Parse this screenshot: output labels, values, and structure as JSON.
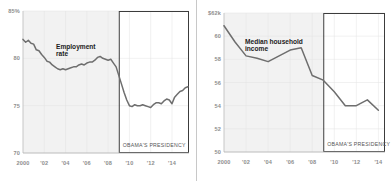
{
  "figure": {
    "panels": [
      {
        "id": "employment-rate",
        "series_title_line1": "Employment",
        "series_title_line2": "rate",
        "annotation": "OBAMA'S PRESIDENCY",
        "y_ticks": [
          "85%",
          "80",
          "75",
          "70"
        ],
        "x_ticks": [
          "2000",
          "'02",
          "'04",
          "'06",
          "'08",
          "'10",
          "'12",
          "'14"
        ]
      },
      {
        "id": "median-household-income",
        "series_title_line1": "Median household",
        "series_title_line2": "income",
        "annotation": "OBAMA'S PRESIDENCY",
        "y_ticks": [
          "$62k",
          "60",
          "58",
          "56",
          "54",
          "52",
          "50"
        ],
        "x_ticks": [
          "2000",
          "'02",
          "'04",
          "'06",
          "'08",
          "'10",
          "'12",
          "'14"
        ]
      }
    ]
  },
  "colors": {
    "line": "#6e6e6e",
    "plot_background": "#f2f2f2",
    "highlight_background": "#ffffff",
    "highlight_border": "#3c3c3c",
    "grid": "#e2e2e2",
    "axis": "#b4b4b4",
    "tick_text": "#8e8e8e",
    "title_text": "#1c1c1c",
    "annotation_text": "#555555"
  },
  "chart_data": [
    {
      "type": "line",
      "title": "Employment rate",
      "xlabel": "",
      "ylabel": "Employment rate (%)",
      "ylim": [
        70,
        85
      ],
      "xlim": [
        2000,
        2015.6
      ],
      "grid": true,
      "legend_position": "inline-label",
      "y_tick_values": [
        85,
        80,
        75,
        70
      ],
      "y_tick_labels": [
        "85%",
        "80",
        "75",
        "70"
      ],
      "x_tick_values": [
        2000,
        2002,
        2004,
        2006,
        2008,
        2010,
        2012,
        2014
      ],
      "x_tick_labels": [
        "2000",
        "'02",
        "'04",
        "'06",
        "'08",
        "'10",
        "'12",
        "'14"
      ],
      "annotations": [
        {
          "text": "OBAMA'S PRESIDENCY",
          "x_start": 2009.0,
          "x_end": 2015.6,
          "type": "shaded-box"
        }
      ],
      "x": [
        2000.0,
        2000.25,
        2000.5,
        2000.75,
        2001.0,
        2001.25,
        2001.5,
        2001.75,
        2002.0,
        2002.25,
        2002.5,
        2002.75,
        2003.0,
        2003.25,
        2003.5,
        2003.75,
        2004.0,
        2004.25,
        2004.5,
        2004.75,
        2005.0,
        2005.25,
        2005.5,
        2005.75,
        2006.0,
        2006.25,
        2006.5,
        2006.75,
        2007.0,
        2007.25,
        2007.5,
        2007.75,
        2008.0,
        2008.25,
        2008.5,
        2008.75,
        2009.0,
        2009.25,
        2009.5,
        2009.75,
        2010.0,
        2010.25,
        2010.5,
        2010.75,
        2011.0,
        2011.25,
        2011.5,
        2011.75,
        2012.0,
        2012.25,
        2012.5,
        2012.75,
        2013.0,
        2013.25,
        2013.5,
        2013.75,
        2014.0,
        2014.25,
        2014.5,
        2014.75,
        2015.0,
        2015.25,
        2015.5
      ],
      "values": [
        82.0,
        81.7,
        81.9,
        81.6,
        81.5,
        80.9,
        80.8,
        80.4,
        80.1,
        79.7,
        79.6,
        79.3,
        79.1,
        78.9,
        78.8,
        78.9,
        78.8,
        78.9,
        79.0,
        79.1,
        79.1,
        79.3,
        79.4,
        79.3,
        79.5,
        79.6,
        79.6,
        79.8,
        80.1,
        80.2,
        80.0,
        79.9,
        79.8,
        79.9,
        79.5,
        79.1,
        78.2,
        77.3,
        76.4,
        75.6,
        75.0,
        74.9,
        75.1,
        75.0,
        75.0,
        75.1,
        75.0,
        74.9,
        74.8,
        75.1,
        75.3,
        75.3,
        75.2,
        75.5,
        75.7,
        75.6,
        75.2,
        75.9,
        76.2,
        76.5,
        76.6,
        76.9,
        77.0
      ]
    },
    {
      "type": "line",
      "title": "Median household income",
      "xlabel": "",
      "ylabel": "Median household income ($ thousands)",
      "ylim": [
        50,
        62
      ],
      "xlim": [
        2000,
        2014.6
      ],
      "grid": true,
      "legend_position": "inline-label",
      "y_tick_values": [
        62,
        60,
        58,
        56,
        54,
        52,
        50
      ],
      "y_tick_labels": [
        "$62k",
        "60",
        "58",
        "56",
        "54",
        "52",
        "50"
      ],
      "x_tick_values": [
        2000,
        2002,
        2004,
        2006,
        2008,
        2010,
        2012,
        2014
      ],
      "x_tick_labels": [
        "2000",
        "'02",
        "'04",
        "'06",
        "'08",
        "'10",
        "'12",
        "'14"
      ],
      "annotations": [
        {
          "text": "OBAMA'S PRESIDENCY",
          "x_start": 2009.0,
          "x_end": 2014.6,
          "type": "shaded-box"
        }
      ],
      "x": [
        2000,
        2001,
        2002,
        2003,
        2004,
        2005,
        2006,
        2007,
        2008,
        2009,
        2010,
        2011,
        2012,
        2013,
        2014
      ],
      "values": [
        60.9,
        59.5,
        58.3,
        58.1,
        57.8,
        58.3,
        58.8,
        59.0,
        56.6,
        56.2,
        55.2,
        54.0,
        54.0,
        54.5,
        53.6
      ]
    }
  ]
}
